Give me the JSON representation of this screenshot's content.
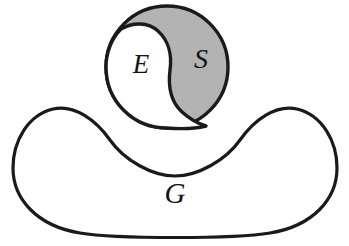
{
  "diagram": {
    "kind": "set-membership-diagram",
    "background_color": "#ffffff",
    "stroke_color": "#1a1a1a",
    "regions": [
      {
        "id": "G",
        "label": "G",
        "name": "universe-blob",
        "fill_color": "#ffffff",
        "stroke_color": "#1a1a1a",
        "stroke_width": 3.2,
        "shape": "bean-blob",
        "label_position": {
          "x": 175,
          "y": 196
        }
      },
      {
        "id": "S",
        "label": "S",
        "name": "s-region",
        "fill_color": "#b3b3b3",
        "stroke_color": "#1a1a1a",
        "stroke_width": 3.4,
        "shape": "circle-minus-lobe",
        "label_position": {
          "x": 201,
          "y": 62
        }
      },
      {
        "id": "E",
        "label": "E",
        "name": "e-region",
        "fill_color": "#ffffff",
        "stroke_color": "#1a1a1a",
        "stroke_width": 3.4,
        "shape": "yin-lobe",
        "label_position": {
          "x": 141,
          "y": 66
        }
      }
    ],
    "circle": {
      "center_x": 167,
      "center_y": 67,
      "radius": 61
    },
    "labels": {
      "e": "E",
      "s": "S",
      "g": "G"
    }
  }
}
